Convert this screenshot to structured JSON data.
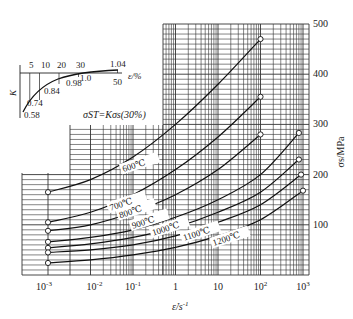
{
  "chart_data": {
    "type": "line",
    "title": "",
    "xlabel": "ε̇/s⁻¹",
    "ylabel": "σs/MPa",
    "xscale": "log",
    "xlim": [
      0.001,
      1000
    ],
    "ylim": [
      0,
      500
    ],
    "x_ticks": [
      "10⁻³",
      "10⁻²",
      "10⁻¹",
      "1",
      "10",
      "10²",
      "10³"
    ],
    "y_ticks": [
      "100",
      "200",
      "300",
      "400",
      "500"
    ],
    "grid": true,
    "formula": "σST=Kσs(30%)",
    "series": [
      {
        "name": "600℃",
        "x": [
          0.001,
          0.01,
          0.1,
          1,
          10,
          100
        ],
        "values": [
          165,
          190,
          235,
          300,
          380,
          470
        ]
      },
      {
        "name": "700℃",
        "x": [
          0.001,
          0.01,
          0.1,
          1,
          10,
          100
        ],
        "values": [
          105,
          125,
          160,
          210,
          275,
          355
        ]
      },
      {
        "name": "800℃",
        "x": [
          0.001,
          0.01,
          0.1,
          1,
          10,
          100
        ],
        "values": [
          88,
          100,
          125,
          160,
          210,
          280
        ]
      },
      {
        "name": "900℃",
        "x": [
          0.001,
          0.01,
          0.1,
          1,
          10,
          100,
          800
        ],
        "values": [
          66,
          75,
          90,
          115,
          150,
          200,
          283
        ]
      },
      {
        "name": "1000℃",
        "x": [
          0.001,
          0.01,
          0.1,
          1,
          10,
          100,
          800
        ],
        "values": [
          54,
          62,
          75,
          95,
          125,
          165,
          230
        ]
      },
      {
        "name": "1100℃",
        "x": [
          0.001,
          0.01,
          0.1,
          1,
          10,
          100,
          900
        ],
        "values": [
          45,
          50,
          60,
          78,
          105,
          140,
          200
        ]
      },
      {
        "name": "1200℃",
        "x": [
          0.001,
          0.01,
          0.1,
          1,
          10,
          100,
          1000
        ],
        "values": [
          24,
          30,
          40,
          55,
          78,
          110,
          168
        ]
      }
    ],
    "inset": {
      "type": "line",
      "xlabel": "ε/%",
      "ylabel": "K",
      "x_ticks": [
        "5",
        "10",
        "20",
        "30",
        "50"
      ],
      "x": [
        0,
        5,
        10,
        20,
        30,
        50
      ],
      "values": [
        0.58,
        0.74,
        0.84,
        0.98,
        1.0,
        1.04
      ],
      "point_labels": [
        "0.58",
        "0.74",
        "0.84",
        "0.98",
        "1.0",
        "1.04"
      ]
    }
  },
  "labels": {
    "x_axis": "ε̇/s",
    "x_axis_sup": "-1",
    "y_axis": "σs/MPa",
    "formula": "σST=Kσs(30%)",
    "inset_x": "ε/%",
    "inset_y": "K"
  }
}
